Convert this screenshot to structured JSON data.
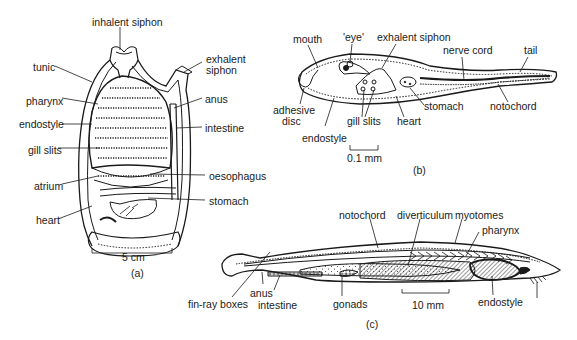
{
  "figure": {
    "panels": [
      {
        "id": "a",
        "caption": "(a)",
        "scale_bar": "5 cm",
        "labels": {
          "inhalent_siphon": "inhalent siphon",
          "exhalent_siphon_1": "exhalent",
          "exhalent_siphon_2": "siphon",
          "tunic": "tunic",
          "pharynx": "pharynx",
          "endostyle": "endostyle",
          "gill_slits": "gill slits",
          "atrium": "atrium",
          "heart": "heart",
          "anus": "anus",
          "intestine": "intestine",
          "oesophagus": "oesophagus",
          "stomach": "stomach"
        }
      },
      {
        "id": "b",
        "caption": "(b)",
        "scale_bar": "0.1 mm",
        "labels": {
          "mouth": "mouth",
          "eye": "'eye'",
          "exhalent_siphon": "exhalent siphon",
          "nerve_cord": "nerve cord",
          "tail": "tail",
          "adhesive_disc_1": "adhesive",
          "adhesive_disc_2": "disc",
          "endostyle": "endostyle",
          "gill_slits": "gill slits",
          "heart": "heart",
          "stomach": "stomach",
          "notochord": "notochord"
        }
      },
      {
        "id": "c",
        "caption": "(c)",
        "scale_bar": "10 mm",
        "labels": {
          "notochord": "notochord",
          "diverticulum": "diverticulum",
          "myotomes": "myotomes",
          "pharynx": "pharynx",
          "fin_ray_boxes": "fin-ray boxes",
          "anus": "anus",
          "intestine": "intestine",
          "gonads": "gonads",
          "endostyle": "endostyle"
        }
      }
    ]
  }
}
